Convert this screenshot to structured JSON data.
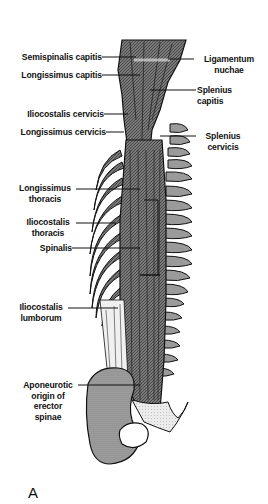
{
  "figure": {
    "panel_letter": "A",
    "top_caption": "Occipital bone",
    "labels_left": [
      {
        "id": "semispinalis-capitis",
        "text": "Semispinalis capitis"
      },
      {
        "id": "longissimus-capitis",
        "text": "Longissimus capitis"
      },
      {
        "id": "iliocostalis-cervicis",
        "text": "Iliocostalis cervicis"
      },
      {
        "id": "longissimus-cervicis",
        "text": "Longissimus cervicis"
      },
      {
        "id": "longissimus-thoracis",
        "line1": "Longissimus",
        "line2": "thoracis"
      },
      {
        "id": "iliocostalis-thoracis",
        "line1": "Iliocostalis",
        "line2": "thoracis"
      },
      {
        "id": "spinalis",
        "text": "Spinalis"
      },
      {
        "id": "iliocostalis-lumborum",
        "line1": "Iliocostalis",
        "line2": "lumborum"
      },
      {
        "id": "aponeurotic-origin",
        "line1": "Aponeurotic",
        "line2": "origin of",
        "line3": "erector",
        "line4": "spinae"
      }
    ],
    "labels_right": [
      {
        "id": "ligamentum-nuchae",
        "line1": "Ligamentum",
        "line2": "nuchae"
      },
      {
        "id": "splenius-capitis",
        "line1": "Splenius",
        "line2": "capitis"
      },
      {
        "id": "splenius-cervicis",
        "line1": "Splenius",
        "line2": "cervicis"
      }
    ],
    "colors": {
      "ink": "#111111",
      "muscle": "#6e6e6e",
      "bone": "#9a9a9a",
      "light": "#d8d8d8",
      "background": "#ffffff"
    }
  }
}
